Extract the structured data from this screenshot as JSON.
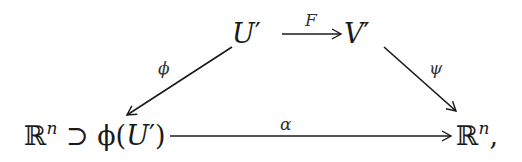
{
  "diagram": {
    "type": "commutative-diagram",
    "nodes": {
      "top_left": {
        "main": "U",
        "prime": "′"
      },
      "top_right": {
        "main": "V",
        "prime": "′"
      },
      "bottom_left": {
        "space": "ℝ",
        "exponent": "n",
        "relation": " ⊃ ",
        "func": "ϕ(",
        "arg": "U",
        "prime": "′",
        "close": ")"
      },
      "bottom_right": {
        "space": "ℝ",
        "exponent": "n",
        "trail": ","
      }
    },
    "arrows": [
      {
        "id": "F",
        "label": "F",
        "from": "U′",
        "to": "V′"
      },
      {
        "id": "phi",
        "label": "ϕ",
        "from": "U′",
        "to": "ℝⁿ ⊃ ϕ(U′)"
      },
      {
        "id": "psi",
        "label": "ψ",
        "from": "V′",
        "to": "ℝⁿ"
      },
      {
        "id": "alpha",
        "label": "α",
        "from": "ℝⁿ ⊃ ϕ(U′)",
        "to": "ℝⁿ"
      }
    ],
    "colors": {
      "ink": "#1a1a1a",
      "background": "#ffffff"
    }
  }
}
